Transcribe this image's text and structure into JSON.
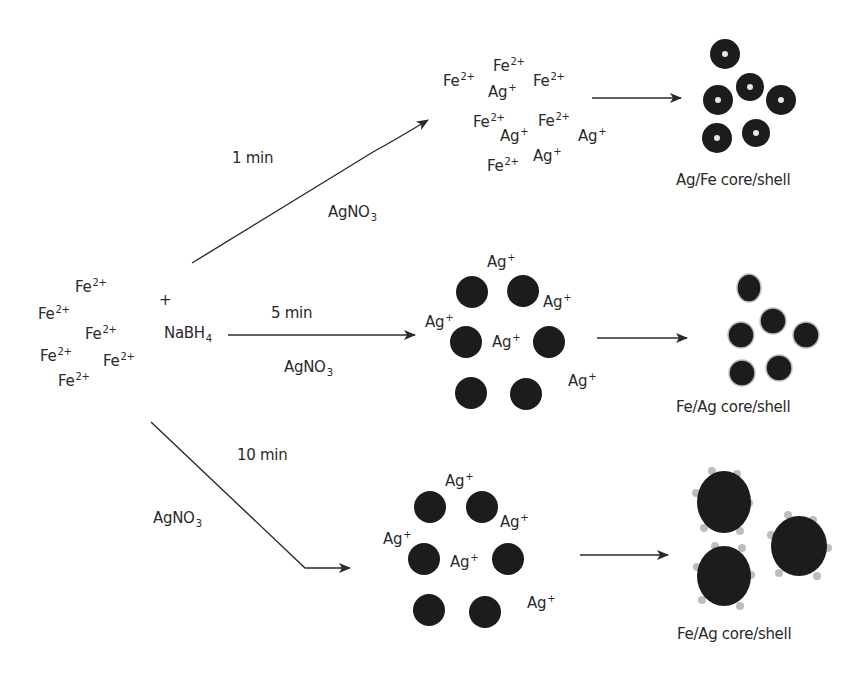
{
  "diagram": {
    "start": {
      "ions": [
        {
          "symbol": "Fe",
          "charge": "2+",
          "x": 75,
          "y": 278
        },
        {
          "symbol": "Fe",
          "charge": "2+",
          "x": 38,
          "y": 305
        },
        {
          "symbol": "Fe",
          "charge": "2+",
          "x": 85,
          "y": 325
        },
        {
          "symbol": "Fe",
          "charge": "2+",
          "x": 40,
          "y": 347
        },
        {
          "symbol": "Fe",
          "charge": "2+",
          "x": 103,
          "y": 352
        },
        {
          "symbol": "Fe",
          "charge": "2+",
          "x": 58,
          "y": 372
        }
      ],
      "plus": "+",
      "reagent": {
        "base": "NaBH",
        "sub": "4"
      }
    },
    "branches": [
      {
        "time": "1 min",
        "reagent": {
          "base": "AgNO",
          "sub": "3"
        },
        "ions": [
          {
            "symbol": "Fe",
            "charge": "2+",
            "x": 493,
            "y": 57
          },
          {
            "symbol": "Fe",
            "charge": "2+",
            "x": 443,
            "y": 72
          },
          {
            "symbol": "Ag",
            "charge": "+",
            "x": 488,
            "y": 83
          },
          {
            "symbol": "Fe",
            "charge": "2+",
            "x": 533,
            "y": 72
          },
          {
            "symbol": "Fe",
            "charge": "2+",
            "x": 473,
            "y": 113
          },
          {
            "symbol": "Ag",
            "charge": "+",
            "x": 500,
            "y": 127
          },
          {
            "symbol": "Fe",
            "charge": "2+",
            "x": 538,
            "y": 112
          },
          {
            "symbol": "Ag",
            "charge": "+",
            "x": 578,
            "y": 127
          },
          {
            "symbol": "Ag",
            "charge": "+",
            "x": 533,
            "y": 147
          },
          {
            "symbol": "Fe",
            "charge": "2+",
            "x": 487,
            "y": 157
          }
        ],
        "product_label": "Ag/Fe core/shell"
      },
      {
        "time": "5 min",
        "reagent": {
          "base": "AgNO",
          "sub": "3"
        },
        "ions": [
          {
            "symbol": "Ag",
            "charge": "+",
            "x": 487,
            "y": 253
          },
          {
            "symbol": "Ag",
            "charge": "+",
            "x": 543,
            "y": 293
          },
          {
            "symbol": "Ag",
            "charge": "+",
            "x": 425,
            "y": 313
          },
          {
            "symbol": "Ag",
            "charge": "+",
            "x": 492,
            "y": 333
          },
          {
            "symbol": "Ag",
            "charge": "+",
            "x": 568,
            "y": 372
          }
        ],
        "product_label": "Fe/Ag core/shell"
      },
      {
        "time": "10 min",
        "reagent": {
          "base": "AgNO",
          "sub": "3"
        },
        "ions": [
          {
            "symbol": "Ag",
            "charge": "+",
            "x": 445,
            "y": 472
          },
          {
            "symbol": "Ag",
            "charge": "+",
            "x": 500,
            "y": 513
          },
          {
            "symbol": "Ag",
            "charge": "+",
            "x": 383,
            "y": 530
          },
          {
            "symbol": "Ag",
            "charge": "+",
            "x": 450,
            "y": 553
          },
          {
            "symbol": "Ag",
            "charge": "+",
            "x": 527,
            "y": 594
          }
        ],
        "product_label": "Fe/Ag core/shell"
      }
    ]
  },
  "colors": {
    "ink": "#2a2a2a",
    "particle": "#1c1c1c",
    "shell_dots": "#bdbdbd",
    "core_light": "#e6e6e6"
  }
}
